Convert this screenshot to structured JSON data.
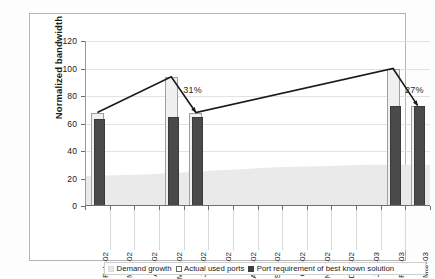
{
  "chart_data": {
    "type": "bar",
    "title": "",
    "xlabel": "",
    "ylabel": "Normalized bandwidth",
    "ylim": [
      0,
      120
    ],
    "ytick_step": 20,
    "yticks": [
      "0",
      "20",
      "40",
      "60",
      "80",
      "100",
      "120"
    ],
    "grid": true,
    "legend_position": "bottom",
    "categories": [
      "Feb-02",
      "Mar-02",
      "Apr-02",
      "May-02",
      "Jun-02",
      "Jul-02",
      "Aug-02",
      "Sep-02",
      "Oct-02",
      "Nov-02",
      "Dec-02",
      "Jan-03",
      "Feb-03",
      "Mar-03"
    ],
    "series": [
      {
        "name": "Demand growth",
        "type": "line",
        "color": "#1a1a1a",
        "values": [
          68,
          null,
          null,
          94,
          68,
          null,
          null,
          null,
          null,
          null,
          null,
          null,
          100,
          73
        ]
      },
      {
        "name": "Actual used ports",
        "type": "bar",
        "color": "#f0f0f0",
        "values": [
          68,
          null,
          null,
          94,
          68,
          null,
          null,
          null,
          null,
          null,
          null,
          null,
          100,
          73
        ]
      },
      {
        "name": "Actual used ports (background band)",
        "type": "area",
        "color": "#eaeaea",
        "values": [
          22,
          22.5,
          23,
          24,
          25,
          26,
          27,
          28,
          28.5,
          29,
          29.5,
          30,
          30,
          30
        ]
      },
      {
        "name": "Port requirement of best known solution",
        "type": "bar",
        "color": "#4a4a4a",
        "values": [
          63,
          null,
          null,
          65,
          65,
          null,
          null,
          null,
          null,
          null,
          null,
          null,
          73,
          73
        ]
      }
    ],
    "annotations": [
      {
        "text": "31%",
        "x": "May-02",
        "y": 84
      },
      {
        "text": "27%",
        "x": "Feb-03",
        "y": 84
      }
    ],
    "legend": [
      {
        "label": "Demand growth",
        "marker": "area-swatch"
      },
      {
        "label": "Actual used ports",
        "marker": "open-square"
      },
      {
        "label": "Port requirement of best known solution",
        "marker": "filled-square"
      }
    ]
  }
}
